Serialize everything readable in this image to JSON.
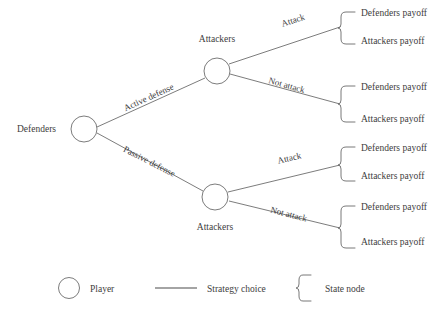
{
  "diagram": {
    "type": "game-tree",
    "title": "",
    "root": {
      "player_label": "Defenders",
      "node_shape": "circle"
    },
    "branches": [
      {
        "strategy_label": "Active defense",
        "child_player_label": "Attackers",
        "choices": [
          {
            "label": "Attack",
            "payoffs": {
              "defender": "Defenders payoff",
              "attacker": "Attackers payoff"
            }
          },
          {
            "label": "Not attack",
            "payoffs": {
              "defender": "Defenders payoff",
              "attacker": "Attackers payoff"
            }
          }
        ]
      },
      {
        "strategy_label": "Passive defense",
        "child_player_label": "Attackers",
        "choices": [
          {
            "label": "Attack",
            "payoffs": {
              "defender": "Defenders payoff",
              "attacker": "Attackers payoff"
            }
          },
          {
            "label": "Not attack",
            "payoffs": {
              "defender": "Defenders payoff",
              "attacker": "Attackers payoff"
            }
          }
        ]
      }
    ]
  },
  "legend": {
    "items": [
      {
        "symbol": "circle",
        "label": "Player"
      },
      {
        "symbol": "line",
        "label": "Strategy choice"
      },
      {
        "symbol": "bracket",
        "label": "State node"
      }
    ]
  },
  "colors": {
    "stroke": "#5a5a5a",
    "text": "#3d3d3d",
    "background": "#ffffff"
  }
}
